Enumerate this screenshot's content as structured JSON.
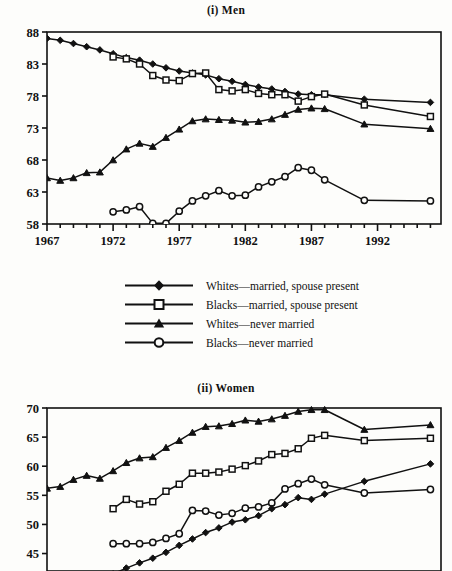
{
  "panels": [
    {
      "id": "men",
      "title": "(i)  Men"
    },
    {
      "id": "women",
      "title": "(ii)  Women"
    }
  ],
  "legend": {
    "entries": [
      {
        "marker": "filled-diamond",
        "label": "Whites—married, spouse present"
      },
      {
        "marker": "open-square",
        "label": "Blacks—married, spouse present"
      },
      {
        "marker": "filled-triangle",
        "label": "Whites—never married"
      },
      {
        "marker": "open-circle",
        "label": "Blacks—never married"
      }
    ]
  },
  "colors": {
    "ink": "#111111",
    "paper": "#fdfdfb"
  },
  "chart_data": [
    {
      "type": "line",
      "title": "(i)  Men",
      "xlabel": "",
      "ylabel": "",
      "xlim": [
        1967,
        1996.8
      ],
      "ylim": [
        58,
        88
      ],
      "yticks": [
        58,
        63,
        68,
        73,
        78,
        83,
        88
      ],
      "xticks_labeled": [
        1967,
        1972,
        1977,
        1982,
        1987,
        1992
      ],
      "xtick_step": 1,
      "grid": false,
      "legend_position": "below-plot",
      "series": [
        {
          "name": "Whites—married, spouse present",
          "marker": "filled-diamond",
          "x": [
            1967,
            1968,
            1969,
            1970,
            1971,
            1972,
            1973,
            1974,
            1975,
            1976,
            1977,
            1978,
            1979,
            1980,
            1981,
            1982,
            1983,
            1984,
            1985,
            1986,
            1987,
            1988,
            1991,
            1996
          ],
          "y": [
            87.0,
            86.7,
            86.2,
            85.7,
            85.2,
            84.6,
            84.0,
            83.6,
            83.0,
            82.4,
            81.9,
            81.6,
            81.3,
            80.7,
            80.3,
            79.8,
            79.4,
            79.1,
            78.7,
            78.3,
            78.2,
            78.2,
            77.5,
            77.0
          ]
        },
        {
          "name": "Blacks—married, spouse present",
          "marker": "open-square",
          "x": [
            1972,
            1973,
            1974,
            1975,
            1976,
            1977,
            1978,
            1979,
            1980,
            1981,
            1982,
            1983,
            1984,
            1985,
            1986,
            1987,
            1988,
            1991,
            1996
          ],
          "y": [
            84.1,
            83.8,
            83.0,
            81.2,
            80.5,
            80.4,
            81.5,
            81.6,
            79.0,
            78.8,
            79.0,
            78.4,
            78.2,
            78.2,
            77.2,
            77.9,
            78.3,
            76.6,
            74.8
          ]
        },
        {
          "name": "Whites—never married",
          "marker": "filled-triangle",
          "x": [
            1967,
            1968,
            1969,
            1970,
            1971,
            1972,
            1973,
            1974,
            1975,
            1976,
            1977,
            1978,
            1979,
            1980,
            1981,
            1982,
            1983,
            1984,
            1985,
            1986,
            1987,
            1988,
            1991,
            1996
          ],
          "y": [
            65.2,
            64.8,
            65.2,
            66.0,
            66.1,
            68.0,
            69.7,
            70.6,
            70.1,
            71.5,
            72.8,
            74.1,
            74.4,
            74.3,
            74.2,
            73.9,
            74.0,
            74.4,
            75.1,
            75.9,
            76.1,
            76.0,
            73.6,
            72.9
          ]
        },
        {
          "name": "Blacks—never married",
          "marker": "open-circle",
          "x": [
            1972,
            1973,
            1974,
            1975,
            1976,
            1977,
            1978,
            1979,
            1980,
            1981,
            1982,
            1983,
            1984,
            1985,
            1986,
            1987,
            1988,
            1991,
            1996
          ],
          "y": [
            59.9,
            60.2,
            60.7,
            58.1,
            58.1,
            60.0,
            61.6,
            62.4,
            63.2,
            62.4,
            62.5,
            63.8,
            64.6,
            65.4,
            66.8,
            66.4,
            64.9,
            61.7,
            61.6
          ]
        }
      ]
    },
    {
      "type": "line",
      "title": "(ii)  Women",
      "xlabel": "",
      "ylabel": "",
      "xlim": [
        1967,
        1996.8
      ],
      "ylim": [
        42,
        70
      ],
      "yticks": [
        45,
        50,
        55,
        60,
        65,
        70
      ],
      "xticks_labeled": [],
      "xtick_step": 1,
      "grid": false,
      "legend_position": "shared-above",
      "note": "bottom of panel is cropped by the image edge",
      "series": [
        {
          "name": "Whites—never married",
          "marker": "filled-triangle",
          "x": [
            1967,
            1968,
            1969,
            1970,
            1971,
            1972,
            1973,
            1974,
            1975,
            1976,
            1977,
            1978,
            1979,
            1980,
            1981,
            1982,
            1983,
            1984,
            1985,
            1986,
            1987,
            1988,
            1991,
            1996
          ],
          "y": [
            56.2,
            56.5,
            57.7,
            58.4,
            57.9,
            59.2,
            60.6,
            61.4,
            61.6,
            63.2,
            64.4,
            65.8,
            66.8,
            66.9,
            67.3,
            67.9,
            67.7,
            68.1,
            68.7,
            69.4,
            69.7,
            69.7,
            66.3,
            67.1
          ]
        },
        {
          "name": "Blacks—married, spouse present",
          "marker": "open-square",
          "x": [
            1972,
            1973,
            1974,
            1975,
            1976,
            1977,
            1978,
            1979,
            1980,
            1981,
            1982,
            1983,
            1984,
            1985,
            1986,
            1987,
            1988,
            1991,
            1996
          ],
          "y": [
            52.7,
            54.3,
            53.5,
            53.9,
            55.7,
            56.9,
            58.8,
            58.8,
            59.0,
            59.5,
            60.1,
            60.9,
            62.0,
            62.2,
            63.0,
            64.8,
            65.3,
            64.4,
            64.8
          ]
        },
        {
          "name": "Blacks—never married",
          "marker": "open-circle",
          "x": [
            1972,
            1973,
            1974,
            1975,
            1976,
            1977,
            1978,
            1979,
            1980,
            1981,
            1982,
            1983,
            1984,
            1985,
            1986,
            1987,
            1988,
            1991,
            1996
          ],
          "y": [
            46.7,
            46.7,
            46.7,
            46.9,
            47.6,
            48.4,
            52.4,
            52.3,
            51.6,
            51.9,
            52.8,
            53.0,
            53.7,
            56.1,
            57.0,
            57.8,
            56.8,
            55.4,
            56.0
          ]
        },
        {
          "name": "Whites—married, spouse present",
          "marker": "filled-diamond",
          "x": [
            1972,
            1973,
            1974,
            1975,
            1976,
            1977,
            1978,
            1979,
            1980,
            1981,
            1982,
            1983,
            1984,
            1985,
            1986,
            1987,
            1988,
            1991,
            1996
          ],
          "y": [
            41.5,
            42.5,
            43.4,
            44.2,
            45.2,
            46.4,
            47.5,
            48.6,
            49.4,
            50.4,
            50.8,
            51.5,
            52.7,
            53.4,
            54.6,
            54.3,
            55.2,
            57.4,
            60.4
          ]
        }
      ]
    }
  ]
}
